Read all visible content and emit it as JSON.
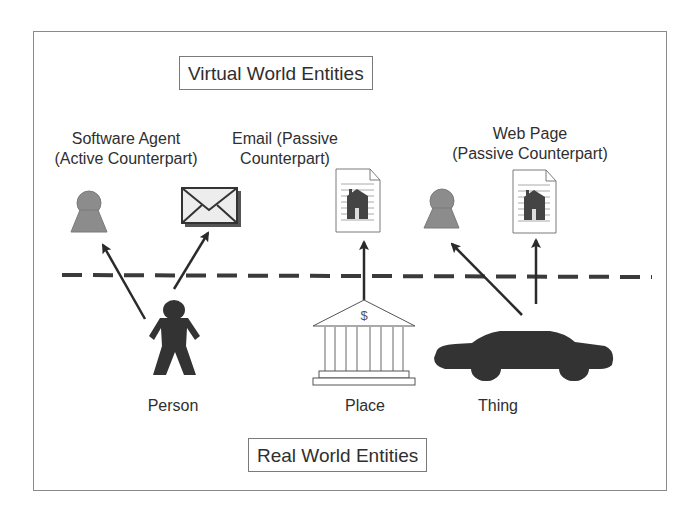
{
  "diagram": {
    "top_region_label": "Virtual World Entities",
    "bottom_region_label": "Real World Entities",
    "divider": "dashed-line",
    "virtual_entities": [
      {
        "id": "software-agent",
        "label_line1": "Software Agent",
        "label_line2": "(Active Counterpart)",
        "icon": "agent-icon"
      },
      {
        "id": "email",
        "label_line1": "Email (Passive",
        "label_line2": "Counterpart)",
        "icon": "envelope-icon"
      },
      {
        "id": "place-web-page",
        "icon": "web-page-icon"
      },
      {
        "id": "thing-agent",
        "icon": "agent-icon"
      },
      {
        "id": "web-page",
        "label_line1": "Web Page",
        "label_line2": "(Passive Counterpart)",
        "icon": "web-page-icon"
      }
    ],
    "real_entities": [
      {
        "id": "person",
        "label": "Person",
        "icon": "person-icon"
      },
      {
        "id": "place",
        "label": "Place",
        "icon": "bank-icon",
        "icon_text": "$"
      },
      {
        "id": "thing",
        "label": "Thing",
        "icon": "car-icon"
      }
    ],
    "connections": [
      {
        "from": "person",
        "to": "software-agent"
      },
      {
        "from": "person",
        "to": "email"
      },
      {
        "from": "place",
        "to": "place-web-page"
      },
      {
        "from": "thing",
        "to": "thing-agent"
      },
      {
        "from": "thing",
        "to": "web-page"
      }
    ],
    "colors": {
      "frame": "#8a8a8a",
      "agent_fill": "#8c8c8c",
      "silhouette_fill": "#333333",
      "arrow": "#2a2a2a",
      "dash": "#3a3a3a"
    }
  }
}
